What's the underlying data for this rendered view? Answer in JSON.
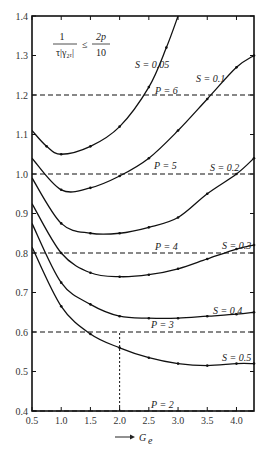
{
  "chart_data": {
    "type": "line",
    "title": "",
    "xlabel": "G_e",
    "xlabel_display": "G",
    "xlabel_sub": "e",
    "ylabel": "",
    "xlim": [
      0.5,
      4.3
    ],
    "ylim": [
      0.4,
      1.4
    ],
    "grid": false,
    "x_ticks": [
      "0.5",
      "1.0",
      "1.5",
      "2.0",
      "2.5",
      "3.0",
      "3.5",
      "4.0"
    ],
    "y_ticks": [
      "0.4",
      "0.5",
      "0.6",
      "0.7",
      "0.8",
      "0.9",
      "1.0",
      "1.1",
      "1.2",
      "1.3",
      "1.4"
    ],
    "annotation_formula": {
      "numerator_left": "1",
      "denominator_left": "τ|γ₂ᵣ|",
      "relation": "≤",
      "numerator_right": "2p",
      "denominator_right": "10"
    },
    "series": [
      {
        "name": "S = 0.05",
        "x": [
          0.5,
          0.75,
          1.0,
          1.5,
          2.0,
          2.5,
          2.8,
          3.0
        ],
        "y": [
          1.11,
          1.07,
          1.05,
          1.07,
          1.12,
          1.22,
          1.32,
          1.4
        ]
      },
      {
        "name": "S = 0.1",
        "x": [
          0.5,
          1.0,
          1.5,
          2.0,
          2.5,
          3.0,
          3.5,
          4.0,
          4.3
        ],
        "y": [
          1.04,
          0.96,
          0.965,
          0.995,
          1.04,
          1.11,
          1.19,
          1.27,
          1.3
        ]
      },
      {
        "name": "S = 0.2",
        "x": [
          0.5,
          1.0,
          1.5,
          2.0,
          2.5,
          3.0,
          3.5,
          4.0,
          4.3
        ],
        "y": [
          0.99,
          0.875,
          0.85,
          0.85,
          0.865,
          0.89,
          0.95,
          1.0,
          1.04
        ]
      },
      {
        "name": "S = 0.3",
        "x": [
          0.5,
          1.0,
          1.5,
          2.0,
          2.5,
          3.0,
          3.5,
          4.0,
          4.3
        ],
        "y": [
          0.925,
          0.8,
          0.75,
          0.74,
          0.745,
          0.76,
          0.785,
          0.81,
          0.82
        ]
      },
      {
        "name": "S = 0.4",
        "x": [
          0.5,
          1.0,
          1.5,
          2.0,
          2.5,
          3.0,
          3.5,
          4.0,
          4.3
        ],
        "y": [
          0.875,
          0.725,
          0.67,
          0.64,
          0.635,
          0.635,
          0.64,
          0.645,
          0.65
        ]
      },
      {
        "name": "S = 0.5",
        "x": [
          0.5,
          1.0,
          1.5,
          2.0,
          2.5,
          3.0,
          3.5,
          4.0,
          4.3
        ],
        "y": [
          0.815,
          0.665,
          0.595,
          0.56,
          0.535,
          0.52,
          0.515,
          0.52,
          0.52
        ]
      }
    ],
    "reference_lines": [
      {
        "name": "P = 6",
        "y": 1.2,
        "style": "dashed"
      },
      {
        "name": "P = 5",
        "y": 1.0,
        "style": "dashed"
      },
      {
        "name": "P = 4",
        "y": 0.8,
        "style": "dashed"
      },
      {
        "name": "P = 3",
        "y": 0.6,
        "style": "dashed"
      },
      {
        "name": "P = 2",
        "y": 0.4,
        "style": "dashed"
      }
    ],
    "vertical_marker": {
      "x": 2.0,
      "y_from": 0.4,
      "y_to": 0.6,
      "style": "dotted"
    },
    "labels": {
      "S005": "S = 0.05",
      "S01": "S = 0.1",
      "S02": "S = 0.2",
      "S03": "S = 0.3",
      "S04": "S = 0.4",
      "S05": "S = 0.5",
      "P6": "P = 6",
      "P5": "P = 5",
      "P4": "P = 4",
      "P3": "P = 3",
      "P2": "P = 2"
    },
    "colors": {
      "line": "#111111",
      "axis": "#111111",
      "background": "#ffffff"
    }
  }
}
